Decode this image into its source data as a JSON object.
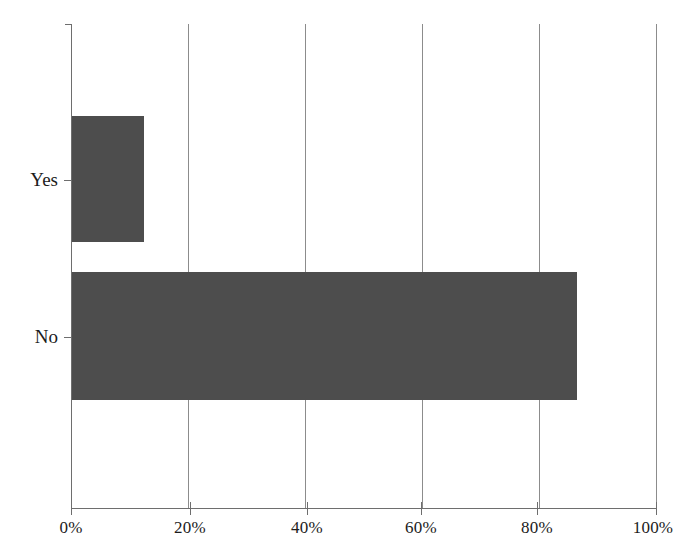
{
  "chart_data": {
    "type": "bar",
    "orientation": "horizontal",
    "title": "",
    "subtitle": "",
    "xlabel": "",
    "ylabel": "",
    "categories": [
      "Yes",
      "No"
    ],
    "values": [
      12.5,
      86.5
    ],
    "value_unit": "%",
    "xlim": [
      0,
      100
    ],
    "xticks": [
      0,
      20,
      40,
      60,
      80,
      100
    ],
    "xticklabels": [
      "0%",
      "20%",
      "40%",
      "60%",
      "80%",
      "100%"
    ],
    "yticklabels": [
      "Yes",
      "No"
    ],
    "grid": "vertical",
    "gridlines_at": [
      0,
      20,
      40,
      60,
      80,
      100
    ],
    "legend": null,
    "legend_position": "none",
    "annotations": [],
    "series": [
      {
        "name": "",
        "values": [
          12.5,
          86.5
        ]
      }
    ],
    "colors": {
      "bar_fill": "#4d4d4d",
      "gridline": "#8c8c8c",
      "axis": "#6e6e6e",
      "background": "#ffffff",
      "text": "#1c1c1c"
    }
  }
}
